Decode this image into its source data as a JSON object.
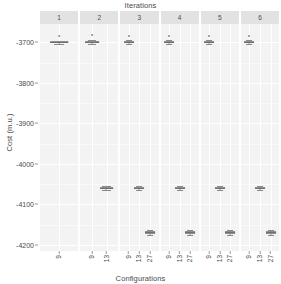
{
  "chart_data": {
    "type": "box",
    "title": "Iterations",
    "xlabel": "Configurations",
    "ylabel": "Cost (m.u.)",
    "ylim": [
      -4215,
      -3655
    ],
    "yticks": [
      -3700,
      -3800,
      -3900,
      -4000,
      -4100,
      -4200
    ],
    "ytick_labels": [
      "-3700",
      "-3800",
      "-3900",
      "-4000",
      "-4100",
      "-4200"
    ],
    "grid": true,
    "legend": "none",
    "facet_variable": "Iterations",
    "facets": [
      {
        "label": "1",
        "configurations": [
          "9"
        ],
        "boxes": [
          {
            "config": "9",
            "lower_whisker": -3704,
            "q1": -3702,
            "median": -3700,
            "q3": -3698,
            "upper_whisker": -3696,
            "outliers": [
              -3684
            ]
          }
        ]
      },
      {
        "label": "2",
        "configurations": [
          "9",
          "13"
        ],
        "boxes": [
          {
            "config": "9",
            "lower_whisker": -3705,
            "q1": -3702,
            "median": -3700,
            "q3": -3698,
            "upper_whisker": -3695,
            "outliers": [
              -3683
            ]
          },
          {
            "config": "13",
            "lower_whisker": -4064,
            "q1": -4061,
            "median": -4059,
            "q3": -4057,
            "upper_whisker": -4054,
            "outliers": []
          }
        ]
      },
      {
        "label": "3",
        "configurations": [
          "9",
          "13",
          "27"
        ],
        "boxes": [
          {
            "config": "9",
            "lower_whisker": -3705,
            "q1": -3702,
            "median": -3700,
            "q3": -3698,
            "upper_whisker": -3695,
            "outliers": [
              -3684
            ]
          },
          {
            "config": "13",
            "lower_whisker": -4064,
            "q1": -4061,
            "median": -4059,
            "q3": -4057,
            "upper_whisker": -4054,
            "outliers": []
          },
          {
            "config": "27",
            "lower_whisker": -4176,
            "q1": -4172,
            "median": -4169,
            "q3": -4166,
            "upper_whisker": -4162,
            "outliers": []
          }
        ]
      },
      {
        "label": "4",
        "configurations": [
          "9",
          "13",
          "27"
        ],
        "boxes": [
          {
            "config": "9",
            "lower_whisker": -3705,
            "q1": -3702,
            "median": -3700,
            "q3": -3698,
            "upper_whisker": -3695,
            "outliers": [
              -3684
            ]
          },
          {
            "config": "13",
            "lower_whisker": -4064,
            "q1": -4061,
            "median": -4059,
            "q3": -4057,
            "upper_whisker": -4054,
            "outliers": []
          },
          {
            "config": "27",
            "lower_whisker": -4176,
            "q1": -4172,
            "median": -4169,
            "q3": -4166,
            "upper_whisker": -4162,
            "outliers": []
          }
        ]
      },
      {
        "label": "5",
        "configurations": [
          "9",
          "13",
          "27"
        ],
        "boxes": [
          {
            "config": "9",
            "lower_whisker": -3705,
            "q1": -3702,
            "median": -3700,
            "q3": -3698,
            "upper_whisker": -3695,
            "outliers": [
              -3684
            ]
          },
          {
            "config": "13",
            "lower_whisker": -4064,
            "q1": -4061,
            "median": -4059,
            "q3": -4057,
            "upper_whisker": -4054,
            "outliers": []
          },
          {
            "config": "27",
            "lower_whisker": -4176,
            "q1": -4172,
            "median": -4169,
            "q3": -4166,
            "upper_whisker": -4162,
            "outliers": []
          }
        ]
      },
      {
        "label": "6",
        "configurations": [
          "9",
          "13",
          "27"
        ],
        "boxes": [
          {
            "config": "9",
            "lower_whisker": -3705,
            "q1": -3702,
            "median": -3700,
            "q3": -3698,
            "upper_whisker": -3695,
            "outliers": [
              -3684
            ]
          },
          {
            "config": "13",
            "lower_whisker": -4064,
            "q1": -4061,
            "median": -4059,
            "q3": -4057,
            "upper_whisker": -4054,
            "outliers": []
          },
          {
            "config": "27",
            "lower_whisker": -4176,
            "q1": -4172,
            "median": -4169,
            "q3": -4166,
            "upper_whisker": -4162,
            "outliers": []
          }
        ]
      }
    ],
    "colors": {
      "panel_background": "#f3f3f3",
      "strip_background": "#e2e2e2",
      "gridline_major": "#ffffff",
      "box_border": "#8d8d8d",
      "box_fill": "#ffffff",
      "text": "#4a4a4a"
    }
  }
}
